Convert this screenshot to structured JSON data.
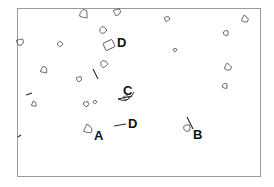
{
  "figure": {
    "type": "annotated-micrograph",
    "background": "#ffffff",
    "frame_color": "#9a9a9a",
    "ink_color": "#2a2a2a"
  },
  "labels": [
    {
      "id": "D-top",
      "text": "D",
      "x": 117,
      "y": 36,
      "size": 13
    },
    {
      "id": "C",
      "text": "C",
      "x": 123,
      "y": 84,
      "size": 13
    },
    {
      "id": "D-mid",
      "text": "D",
      "x": 128,
      "y": 117,
      "size": 13
    },
    {
      "id": "A",
      "text": "A",
      "x": 94,
      "y": 129,
      "size": 13
    },
    {
      "id": "B",
      "text": "B",
      "x": 193,
      "y": 128,
      "size": 13
    }
  ],
  "pointers": [
    {
      "label": "D-mid",
      "x1": 114,
      "y1": 126,
      "x2": 126,
      "y2": 124
    },
    {
      "label": "B",
      "x1": 187,
      "y1": 117,
      "x2": 193,
      "y2": 129
    },
    {
      "label": "C",
      "x1": 118,
      "y1": 99,
      "x2": 132,
      "y2": 96
    },
    {
      "label": "free-left-1",
      "x1": 26,
      "y1": 95,
      "x2": 32,
      "y2": 93
    },
    {
      "label": "free-left-2",
      "x1": 18,
      "y1": 137,
      "x2": 21,
      "y2": 135
    },
    {
      "label": "free-mid",
      "x1": 93,
      "y1": 69,
      "x2": 98,
      "y2": 79
    }
  ],
  "particles": [
    {
      "x": 84,
      "y": 14,
      "r": 5
    },
    {
      "x": 117,
      "y": 12,
      "r": 4
    },
    {
      "x": 103,
      "y": 30,
      "r": 4
    },
    {
      "x": 109,
      "y": 45,
      "r": 5,
      "shape": "block"
    },
    {
      "x": 20,
      "y": 42,
      "r": 4
    },
    {
      "x": 60,
      "y": 44,
      "r": 3
    },
    {
      "x": 44,
      "y": 70,
      "r": 4
    },
    {
      "x": 79,
      "y": 79,
      "r": 3
    },
    {
      "x": 104,
      "y": 64,
      "r": 4
    },
    {
      "x": 34,
      "y": 104,
      "r": 3
    },
    {
      "x": 86,
      "y": 104,
      "r": 3
    },
    {
      "x": 95,
      "y": 102,
      "r": 2
    },
    {
      "x": 88,
      "y": 129,
      "r": 5
    },
    {
      "x": 187,
      "y": 128,
      "r": 4
    },
    {
      "x": 167,
      "y": 19,
      "r": 3
    },
    {
      "x": 245,
      "y": 19,
      "r": 4
    },
    {
      "x": 226,
      "y": 33,
      "r": 3
    },
    {
      "x": 175,
      "y": 50,
      "r": 2
    },
    {
      "x": 228,
      "y": 67,
      "r": 4
    },
    {
      "x": 225,
      "y": 86,
      "r": 3
    },
    {
      "x": 126,
      "y": 98,
      "r": 3
    }
  ]
}
